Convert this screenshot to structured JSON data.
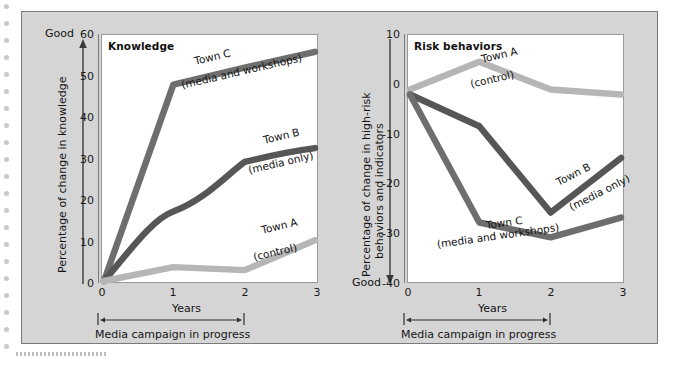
{
  "figure": {
    "background": "#d5d5d5",
    "plot_background": "#ffffff",
    "border_color": "#7a7a7a"
  },
  "colors": {
    "town_a": "#b6b6b6",
    "town_b": "#565656",
    "town_c": "#6e6e6e",
    "axis": "#7b7b7b",
    "text": "#141414"
  },
  "chart_data": [
    {
      "type": "line",
      "title": "Knowledge",
      "xlabel": "Years",
      "ylabel": "Percentage of change in knowledge",
      "ylabel_good": "Good",
      "good_direction": "up",
      "x": [
        0,
        1,
        2,
        3
      ],
      "xlim": [
        0,
        3
      ],
      "ylim": [
        0,
        60
      ],
      "xticks": [
        "0",
        "1",
        "2",
        "3"
      ],
      "yticks": [
        "0",
        "10",
        "20",
        "30",
        "40",
        "50",
        "60"
      ],
      "grid": false,
      "legend_position": "inline-annotations",
      "annotation": "Media campaign in progress",
      "annotation_span_years": [
        0,
        2
      ],
      "series": [
        {
          "name": "Town A",
          "sublabel": "(control)",
          "color": "#b6b6b6",
          "values": [
            0,
            3.5,
            3,
            10
          ]
        },
        {
          "name": "Town B",
          "sublabel": "(media only)",
          "color": "#565656",
          "values": [
            0,
            17,
            29,
            32.5
          ]
        },
        {
          "name": "Town C",
          "sublabel": "(media and workshops)",
          "color": "#6e6e6e",
          "values": [
            0,
            48,
            52,
            56
          ]
        }
      ]
    },
    {
      "type": "line",
      "title": "Risk behaviors",
      "xlabel": "Years",
      "ylabel": "Percentage of change in high-risk behaviors and indicators",
      "ylabel_good": "Good",
      "good_direction": "down",
      "x": [
        0,
        1,
        2,
        3
      ],
      "xlim": [
        0,
        3
      ],
      "ylim": [
        -40,
        10
      ],
      "xticks": [
        "0",
        "1",
        "2",
        "3"
      ],
      "yticks": [
        "-40",
        "-30",
        "-20",
        "-10",
        "0",
        "10"
      ],
      "grid": false,
      "legend_position": "inline-annotations",
      "annotation": "Media campaign in progress",
      "annotation_span_years": [
        0,
        2
      ],
      "series": [
        {
          "name": "Town A",
          "sublabel": "(control)",
          "color": "#b6b6b6",
          "values": [
            -1,
            4.5,
            -1,
            -2
          ]
        },
        {
          "name": "Town B",
          "sublabel": "(media only)",
          "color": "#565656",
          "values": [
            -2,
            -8.5,
            -26,
            -15
          ]
        },
        {
          "name": "Town C",
          "sublabel": "(media and workshops)",
          "color": "#6e6e6e",
          "values": [
            -2,
            -28,
            -31,
            -27
          ]
        }
      ]
    }
  ],
  "left": {
    "title": "Knowledge",
    "ylabel": "Percentage of change in knowledge",
    "good": "Good",
    "xlabel": "Years",
    "campaign": "Media campaign in progress",
    "yticks": [
      "60",
      "50",
      "40",
      "30",
      "20",
      "10",
      "0"
    ],
    "xticks": [
      "0",
      "1",
      "2",
      "3"
    ],
    "labels": {
      "town_c_name": "Town C",
      "town_c_sub": "(media and workshops)",
      "town_b_name": "Town B",
      "town_b_sub": "(media only)",
      "town_a_name": "Town A",
      "town_a_sub": "(control)"
    }
  },
  "right": {
    "title": "Risk behaviors",
    "ylabel_line1": "Percentage of change in high-risk",
    "ylabel_line2": "behaviors and indicators",
    "good": "Good",
    "xlabel": "Years",
    "campaign": "Media campaign in progress",
    "yticks": [
      "10",
      "0",
      "-10",
      "-20",
      "-30",
      "-40"
    ],
    "xticks": [
      "0",
      "1",
      "2",
      "3"
    ],
    "labels": {
      "town_a_name": "Town A",
      "town_a_sub": "(control)",
      "town_b_name": "Town B",
      "town_b_sub": "(media only)",
      "town_c_name": "Town C",
      "town_c_sub": "(media and workshops)"
    }
  }
}
